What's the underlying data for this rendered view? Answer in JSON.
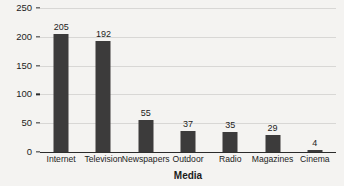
{
  "chart_data": {
    "type": "bar",
    "title": "",
    "xlabel": "Media",
    "ylabel": "Expenditure (US$ million)",
    "categories": [
      "Internet",
      "Television",
      "Newspapers",
      "Outdoor",
      "Radio",
      "Magazines",
      "Cinema"
    ],
    "values": [
      205,
      192,
      55,
      37,
      35,
      29,
      4
    ],
    "yticks": [
      0,
      50,
      100,
      150,
      200,
      250
    ],
    "ylim": [
      0,
      250
    ],
    "grid": true,
    "legend": null,
    "bar_color": "#3c3b3b",
    "background_color": "#f4f3f1",
    "gridline_color": "#d8d7d5",
    "axis_color": "#2b2b2b"
  }
}
